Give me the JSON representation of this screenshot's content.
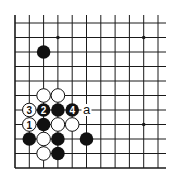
{
  "diagram": {
    "type": "go-board-fragment",
    "grid": {
      "columns": 11,
      "rows": 11,
      "origin_x": 15,
      "origin_y": 23,
      "spacing_x": 14.3,
      "spacing_y": 14.5,
      "open_top": true,
      "open_right": true,
      "closed_left": true,
      "closed_bottom": true
    },
    "star_points": [
      {
        "col": 3,
        "row": 1
      },
      {
        "col": 9,
        "row": 1
      },
      {
        "col": 9,
        "row": 7
      }
    ],
    "stones": [
      {
        "col": 2,
        "row": 2,
        "color": "black",
        "label": ""
      },
      {
        "col": 2,
        "row": 5,
        "color": "white",
        "label": ""
      },
      {
        "col": 3,
        "row": 5,
        "color": "white",
        "label": ""
      },
      {
        "col": 1,
        "row": 6,
        "color": "white",
        "label": "3"
      },
      {
        "col": 2,
        "row": 6,
        "color": "black",
        "label": "2"
      },
      {
        "col": 3,
        "row": 6,
        "color": "black",
        "label": ""
      },
      {
        "col": 4,
        "row": 6,
        "color": "black",
        "label": "4"
      },
      {
        "col": 1,
        "row": 7,
        "color": "white",
        "label": "1"
      },
      {
        "col": 2,
        "row": 7,
        "color": "black",
        "label": ""
      },
      {
        "col": 3,
        "row": 7,
        "color": "white",
        "label": ""
      },
      {
        "col": 4,
        "row": 7,
        "color": "white",
        "label": ""
      },
      {
        "col": 1,
        "row": 8,
        "color": "black",
        "label": ""
      },
      {
        "col": 2,
        "row": 8,
        "color": "white",
        "label": ""
      },
      {
        "col": 3,
        "row": 8,
        "color": "black",
        "label": ""
      },
      {
        "col": 5,
        "row": 8,
        "color": "black",
        "label": ""
      },
      {
        "col": 2,
        "row": 9,
        "color": "white",
        "label": ""
      },
      {
        "col": 3,
        "row": 9,
        "color": "black",
        "label": ""
      }
    ],
    "markers": [
      {
        "col": 5,
        "row": 6,
        "text": "a"
      }
    ],
    "colors": {
      "line": "#1a1a1a",
      "black_stone": "#111111",
      "white_stone": "#ffffff",
      "background": "#ffffff"
    }
  }
}
